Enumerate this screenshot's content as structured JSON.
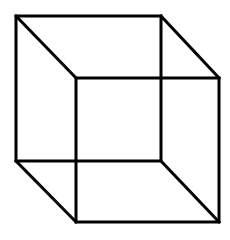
{
  "figure": {
    "title": "Necker cube",
    "background": "#ffffff",
    "stroke": "#000000",
    "stroke_width": 3,
    "back_face": {
      "x1": 16,
      "y1": 16,
      "x2": 161,
      "y2": 161
    },
    "front_face": {
      "x1": 76,
      "y1": 78,
      "x2": 219,
      "y2": 222
    }
  }
}
